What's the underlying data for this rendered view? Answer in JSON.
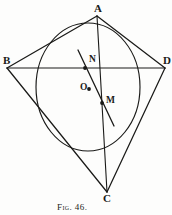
{
  "figure": {
    "caption": "Fig. 46.",
    "caption_prefix": "Fig.",
    "caption_number": "46.",
    "kind": "geometric-diagram",
    "ink_color": "#1a1a18",
    "background_color": "#fdfdfc"
  },
  "vertices": [
    {
      "id": "A",
      "label": "A",
      "x": 97,
      "y": 16,
      "label_x": 94,
      "label_y": 3
    },
    {
      "id": "B",
      "label": "B",
      "x": 7,
      "y": 68,
      "label_x": 3,
      "label_y": 55
    },
    {
      "id": "C",
      "label": "C",
      "x": 107,
      "y": 192,
      "label_x": 103,
      "label_y": 193
    },
    {
      "id": "D",
      "label": "D",
      "x": 165,
      "y": 68,
      "label_x": 163,
      "label_y": 55
    }
  ],
  "points": [
    {
      "id": "N",
      "label": "N",
      "x": 85,
      "y": 68,
      "label_x": 89,
      "label_y": 55
    },
    {
      "id": "O",
      "label": "O",
      "x": 89,
      "y": 89,
      "label_x": 80,
      "label_y": 83
    },
    {
      "id": "M",
      "label": "M",
      "x": 102,
      "y": 103,
      "label_x": 106,
      "label_y": 96
    }
  ],
  "circle": {
    "id": "inscribed-circle",
    "center_x": 88,
    "center_y": 87,
    "radius_x": 52,
    "radius_y": 64
  },
  "segments": [
    {
      "id": "AB",
      "from": "A",
      "to": "B",
      "x1": 97,
      "y1": 16,
      "x2": 7,
      "y2": 68
    },
    {
      "id": "AD",
      "from": "A",
      "to": "D",
      "x1": 97,
      "y1": 16,
      "x2": 165,
      "y2": 68
    },
    {
      "id": "BC",
      "from": "B",
      "to": "C",
      "x1": 7,
      "y1": 68,
      "x2": 107,
      "y2": 192
    },
    {
      "id": "DC",
      "from": "D",
      "to": "C",
      "x1": 165,
      "y1": 68,
      "x2": 107,
      "y2": 192
    },
    {
      "id": "BD",
      "from": "B",
      "to": "D",
      "x1": 7,
      "y1": 68,
      "x2": 165,
      "y2": 68
    },
    {
      "id": "AC",
      "from": "A",
      "to": "C",
      "x1": 97,
      "y1": 16,
      "x2": 107,
      "y2": 192
    },
    {
      "id": "chord-NM",
      "from": "N",
      "to": "M",
      "x1": 78,
      "y1": 50,
      "x2": 114,
      "y2": 126
    }
  ]
}
